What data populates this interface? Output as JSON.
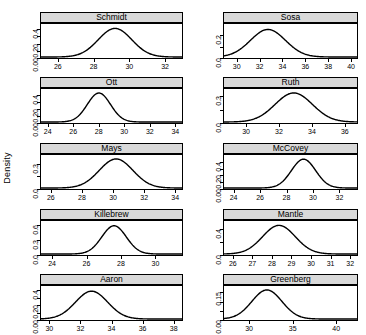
{
  "chart_data": {
    "type": "line",
    "title": "",
    "xlabel": "",
    "ylabel": "Density",
    "layout": {
      "rows": 5,
      "cols": 2,
      "grid": false,
      "legend": "none",
      "strip_background": "#d9d9d9"
    },
    "panels": [
      {
        "name": "Schmidt",
        "row": 0,
        "col": 0,
        "xlim": [
          25.0,
          33.0
        ],
        "xticks": [
          26,
          28,
          30,
          32
        ],
        "xticklabels": [
          "26",
          "28",
          "30",
          "32"
        ],
        "ylim": [
          0.0,
          0.47
        ],
        "yticks": [
          0.0,
          0.1,
          0.2,
          0.3,
          0.4
        ],
        "yticklabels": [
          "0.00",
          "",
          "0.20",
          "",
          "0.4"
        ],
        "ylabels_shown": [
          0.0,
          0.2,
          0.4
        ],
        "ylabels_text": [
          "0.00",
          "0.20",
          "0.4"
        ],
        "density": {
          "mean": 29.2,
          "sd": 0.95,
          "peak": 0.42
        }
      },
      {
        "name": "Sosa",
        "row": 0,
        "col": 1,
        "xlim": [
          28.8,
          40.6
        ],
        "xticks": [
          30,
          32,
          34,
          36,
          38,
          40
        ],
        "xticklabels": [
          "30",
          "32",
          "34",
          "36",
          "38",
          "40"
        ],
        "ylim": [
          0.0,
          0.3
        ],
        "yticks": [
          0.0,
          0.1,
          0.2
        ],
        "yticklabels": [
          "0.0",
          "",
          "0.2"
        ],
        "ylabels_shown": [
          0.0,
          0.2
        ],
        "ylabels_text": [
          "0.0",
          "0.2"
        ],
        "density": {
          "mean": 32.7,
          "sd": 1.55,
          "peak": 0.258
        }
      },
      {
        "name": "Ott",
        "row": 1,
        "col": 0,
        "xlim": [
          23.4,
          34.6
        ],
        "xticks": [
          24,
          26,
          28,
          30,
          32,
          34
        ],
        "xticklabels": [
          "24",
          "26",
          "28",
          "30",
          "32",
          "34"
        ],
        "ylim": [
          0.0,
          0.48
        ],
        "yticks": [
          0.0,
          0.1,
          0.2,
          0.3,
          0.4
        ],
        "yticklabels": [
          "0.00",
          "",
          "0.20",
          "",
          "0.4"
        ],
        "ylabels_shown": [
          0.0,
          0.2,
          0.4
        ],
        "ylabels_text": [
          "0.00",
          "0.20",
          "0.4"
        ],
        "density": {
          "mean": 28.0,
          "sd": 0.92,
          "peak": 0.435
        }
      },
      {
        "name": "Ruth",
        "row": 1,
        "col": 1,
        "xlim": [
          28.6,
          36.8
        ],
        "xticks": [
          30,
          32,
          34,
          36
        ],
        "xticklabels": [
          "30",
          "32",
          "34",
          "36"
        ],
        "ylim": [
          0.0,
          0.38
        ],
        "yticks": [
          0.0,
          0.15,
          0.3
        ],
        "yticklabels": [
          "0.0",
          "",
          "0.3"
        ],
        "ylabels_shown": [
          0.0,
          0.3
        ],
        "ylabels_text": [
          "0.0",
          "0.3"
        ],
        "density": {
          "mean": 32.9,
          "sd": 1.15,
          "peak": 0.345
        }
      },
      {
        "name": "Mays",
        "row": 2,
        "col": 0,
        "xlim": [
          25.3,
          34.5
        ],
        "xticks": [
          26,
          28,
          30,
          32,
          34
        ],
        "xticklabels": [
          "26",
          "28",
          "30",
          "32",
          "34"
        ],
        "ylim": [
          0.0,
          0.4
        ],
        "yticks": [
          0.0,
          0.15,
          0.3
        ],
        "yticklabels": [
          "0.0",
          "",
          "0.3"
        ],
        "ylabels_shown": [
          0.0,
          0.3
        ],
        "ylabels_text": [
          "0.0",
          "0.3"
        ],
        "density": {
          "mean": 30.2,
          "sd": 1.1,
          "peak": 0.363
        }
      },
      {
        "name": "McCovey",
        "row": 2,
        "col": 1,
        "xlim": [
          23.2,
          33.4
        ],
        "xticks": [
          24,
          26,
          28,
          30,
          32
        ],
        "xticklabels": [
          "24",
          "26",
          "28",
          "30",
          "32"
        ],
        "ylim": [
          0.0,
          0.5
        ],
        "yticks": [
          0.0,
          0.1,
          0.2,
          0.3,
          0.4
        ],
        "yticklabels": [
          "0.00",
          "",
          "0.20",
          "",
          "0.4"
        ],
        "ylabels_shown": [
          0.0,
          0.2,
          0.4
        ],
        "ylabels_text": [
          "0.00",
          "0.20",
          "0.4"
        ],
        "density": {
          "mean": 29.3,
          "sd": 0.93,
          "peak": 0.45
        }
      },
      {
        "name": "Killebrew",
        "row": 3,
        "col": 0,
        "xlim": [
          23.3,
          31.6
        ],
        "xticks": [
          24,
          26,
          28,
          30
        ],
        "xticklabels": [
          "24",
          "26",
          "28",
          "30"
        ],
        "ylim": [
          0.0,
          0.68
        ],
        "yticks": [
          0.0,
          0.3,
          0.6
        ],
        "yticklabels": [
          "0.0",
          "0.3",
          "0.6"
        ],
        "ylabels_shown": [
          0.0,
          0.3,
          0.6
        ],
        "ylabels_text": [
          "0.0",
          "0.3",
          "0.6"
        ],
        "density": {
          "mean": 27.6,
          "sd": 0.72,
          "peak": 0.6
        }
      },
      {
        "name": "Mantle",
        "row": 3,
        "col": 1,
        "xlim": [
          25.5,
          32.4
        ],
        "xticks": [
          26,
          27,
          28,
          29,
          30,
          31,
          32
        ],
        "xticklabels": [
          "26",
          "27",
          "28",
          "29",
          "30",
          "31",
          "32"
        ],
        "ylim": [
          0.0,
          0.52
        ],
        "yticks": [
          0.0,
          0.2,
          0.4
        ],
        "yticklabels": [
          "0.0",
          "",
          "0.4"
        ],
        "ylabels_shown": [
          0.0,
          0.4
        ],
        "ylabels_text": [
          "0.0",
          "0.4"
        ],
        "density": {
          "mean": 28.35,
          "sd": 0.85,
          "peak": 0.465
        }
      },
      {
        "name": "Aaron",
        "row": 4,
        "col": 0,
        "xlim": [
          29.4,
          38.6
        ],
        "xticks": [
          30,
          32,
          34,
          36,
          38
        ],
        "xticklabels": [
          "30",
          "32",
          "34",
          "36",
          "38"
        ],
        "ylim": [
          0.0,
          0.46
        ],
        "yticks": [
          0.0,
          0.1,
          0.2,
          0.3,
          0.4
        ],
        "yticklabels": [
          "0.00",
          "",
          "0.20",
          "",
          "0.4"
        ],
        "ylabels_shown": [
          0.0,
          0.2,
          0.4
        ],
        "ylabels_text": [
          "0.00",
          "0.20",
          "0.4"
        ],
        "density": {
          "mean": 32.7,
          "sd": 1.05,
          "peak": 0.4
        }
      },
      {
        "name": "Greenberg",
        "row": 4,
        "col": 1,
        "xlim": [
          27.0,
          42.5
        ],
        "xticks": [
          30,
          35,
          40
        ],
        "xticklabels": [
          "30",
          "35",
          "40"
        ],
        "ylim": [
          0.0,
          0.185
        ],
        "yticks": [
          0.0,
          0.05,
          0.1,
          0.15
        ],
        "yticklabels": [
          "0.00",
          "",
          "",
          "0.15"
        ],
        "ylabels_shown": [
          0.0,
          0.15
        ],
        "ylabels_text": [
          "0.00",
          "0.15"
        ],
        "density": {
          "mean": 32.0,
          "sd": 1.75,
          "peak": 0.168
        }
      }
    ]
  },
  "axis_titles": {
    "y": "Density"
  }
}
